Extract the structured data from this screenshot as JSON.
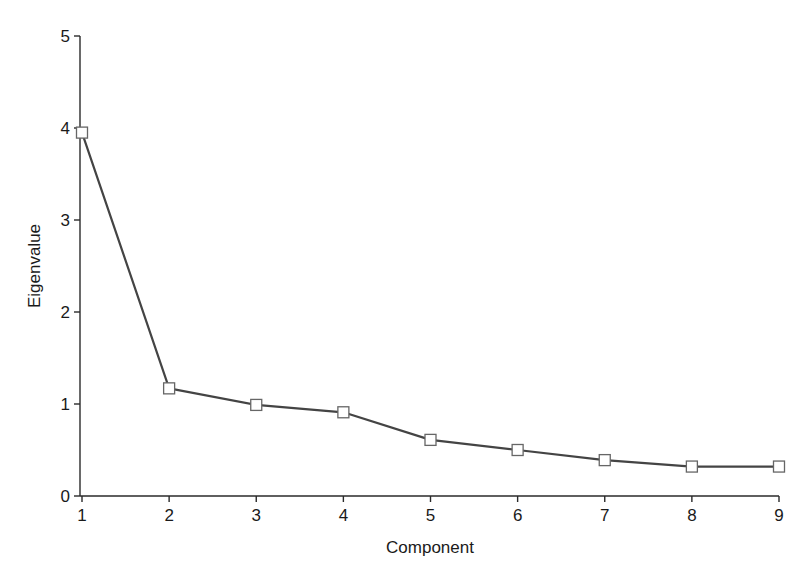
{
  "chart_data": {
    "type": "line",
    "title": "",
    "xlabel": "Component",
    "ylabel": "Eigenvalue",
    "x": [
      1,
      2,
      3,
      4,
      5,
      6,
      7,
      8,
      9
    ],
    "series": [
      {
        "name": "Eigenvalue",
        "values": [
          3.95,
          1.17,
          0.99,
          0.91,
          0.61,
          0.5,
          0.39,
          0.32,
          0.32
        ],
        "marker": "open-square",
        "color": "#444444"
      }
    ],
    "xticks": [
      "1",
      "2",
      "3",
      "4",
      "5",
      "6",
      "7",
      "8",
      "9"
    ],
    "yticks": [
      "0",
      "1",
      "2",
      "3",
      "4",
      "5"
    ],
    "xlim": [
      1,
      9
    ],
    "ylim": [
      0,
      5
    ],
    "grid": false,
    "legend": null
  },
  "axes": {
    "x_title": "Component",
    "y_title": "Eigenvalue"
  }
}
